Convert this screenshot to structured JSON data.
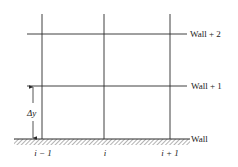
{
  "diagram": {
    "colors": {
      "line": "#2a2a2a",
      "background": "#ffffff",
      "hatch": "#555555"
    },
    "row_labels": {
      "wall": "Wall",
      "wall_plus_1": "Wall + 1",
      "wall_plus_2": "Wall + 2"
    },
    "column_labels": {
      "left": "i − 1",
      "center": "i",
      "right": "i + 1"
    },
    "spacing_label": "Δy"
  }
}
